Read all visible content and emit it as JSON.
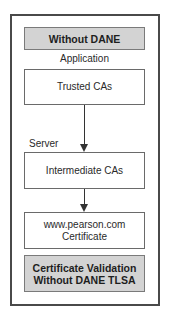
{
  "diagram": {
    "header": "Without DANE",
    "application_label": "Application",
    "server_label": "Server",
    "nodes": [
      {
        "id": "trusted-cas",
        "label": "Trusted CAs"
      },
      {
        "id": "intermediate-cas",
        "label": "Intermediate CAs"
      },
      {
        "id": "certificate",
        "line1": "www.pearson.com",
        "line2": "Certificate"
      }
    ],
    "footer": {
      "line1": "Certificate Validation",
      "line2": "Without DANE TLSA"
    },
    "edges": [
      {
        "from": "trusted-cas",
        "to": "intermediate-cas"
      },
      {
        "from": "intermediate-cas",
        "to": "certificate"
      }
    ],
    "colors": {
      "gray_box": "#d3d3d3",
      "border": "#4a4a4a",
      "arrow": "#333333"
    }
  }
}
